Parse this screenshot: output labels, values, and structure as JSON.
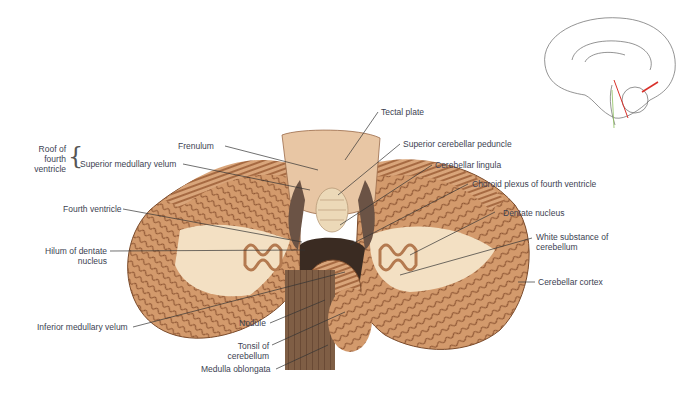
{
  "figure": {
    "labels": {
      "tectal_plate": "Tectal plate",
      "frenulum": "Frenulum",
      "superior_cerebellar_peduncle": "Superior cerebellar peduncle",
      "roof_group_line1": "Roof of",
      "roof_group_line2": "fourth",
      "roof_group_line3": "ventricle",
      "superior_medullary_velum": "Superior medullary velum",
      "cerebellar_lingula": "Cerebellar lingula",
      "choroid_plexus": "Choroid plexus of fourth ventricle",
      "fourth_ventricle": "Fourth ventricle",
      "dentate_nucleus": "Dentate nucleus",
      "hilum_line1": "Hilum of dentate",
      "hilum_line2": "nucleus",
      "white_substance_line1": "White substance of",
      "white_substance_line2": "cerebellum",
      "cerebellar_cortex": "Cerebellar cortex",
      "inferior_medullary_velum": "Inferior medullary velum",
      "nodule": "Nodule",
      "tonsil_line1": "Tonsil of",
      "tonsil_line2": "cerebellum",
      "medulla_oblongata": "Medulla oblongata"
    },
    "inset": {
      "description": "Sagittal brain outline with red section line and arrow",
      "accent_color": "#d9302a"
    },
    "colors": {
      "cortex": "#c98f62",
      "white_matter": "#f4e2c6",
      "brainstem": "#7a5a42",
      "label_text": "#3c3f52",
      "leader_line": "#333333"
    }
  }
}
